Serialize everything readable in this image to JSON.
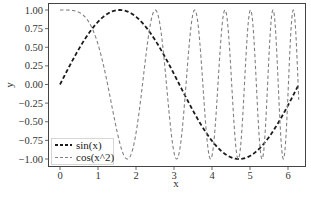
{
  "chart_data": {
    "type": "line",
    "title": "",
    "xlabel": "x",
    "ylabel": "y",
    "xlim": [
      -0.31,
      6.45
    ],
    "ylim": [
      -1.1,
      1.1
    ],
    "grid": false,
    "legend_position": "lower left",
    "x_ticks": [
      0,
      1,
      2,
      3,
      4,
      5,
      6
    ],
    "x_tick_labels": [
      "0",
      "1",
      "2",
      "3",
      "4",
      "5",
      "6"
    ],
    "y_ticks": [
      1.0,
      0.75,
      0.5,
      0.25,
      0.0,
      -0.25,
      -0.5,
      -0.75,
      -1.0
    ],
    "y_tick_labels": [
      "1.00",
      "0.75",
      "0.50",
      "0.25",
      "0.00",
      "−0.25",
      "−0.50",
      "−0.75",
      "−1.00"
    ],
    "x_range": [
      0,
      6.283
    ],
    "series": [
      {
        "name": "sin(x)",
        "function": "sin(x)",
        "color": "#1a1a1a",
        "style": "dashed",
        "width": 1.8
      },
      {
        "name": "cos(x^2)",
        "function": "cos(x^2)",
        "color": "#808080",
        "style": "dashed",
        "width": 1.1
      }
    ],
    "sample_points": {
      "x": [
        0,
        0.5,
        1.0,
        1.5,
        2.0,
        2.5,
        3.0,
        3.5,
        4.0,
        4.5,
        5.0,
        5.5,
        6.0,
        6.28
      ],
      "sin(x)": [
        0.0,
        0.48,
        0.84,
        1.0,
        0.91,
        0.6,
        0.14,
        -0.35,
        -0.76,
        -0.98,
        -0.96,
        -0.71,
        -0.28,
        0.0
      ],
      "cos(x^2)": [
        1.0,
        0.97,
        0.54,
        -0.63,
        -0.65,
        1.0,
        -0.91,
        0.97,
        -0.96,
        0.87,
        0.99,
        -0.88,
        -0.99,
        0.97
      ]
    }
  },
  "legend": {
    "items": [
      {
        "label": "sin(x)"
      },
      {
        "label": "cos(x^2)"
      }
    ]
  },
  "axes": {
    "xlabel": "x",
    "ylabel": "y"
  }
}
